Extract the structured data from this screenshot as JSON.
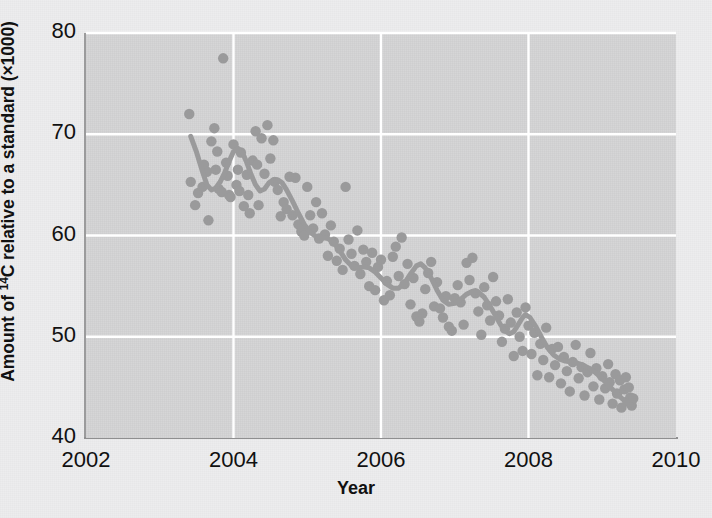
{
  "chart_data": {
    "type": "scatter",
    "title": "",
    "xlabel": "Year",
    "ylabel_parts": {
      "pre": "Amount of ",
      "sup": "14",
      "post": "C relative to a standard (×1000)"
    },
    "ylabel": "Amount of 14C relative to a standard (×1000)",
    "xlim": [
      2002,
      2010
    ],
    "ylim": [
      40,
      80
    ],
    "xticks": [
      "2002",
      "2004",
      "2006",
      "2008",
      "2010"
    ],
    "xtick_values": [
      2002,
      2004,
      2006,
      2008,
      2010
    ],
    "yticks": [
      "40",
      "50",
      "60",
      "70",
      "80"
    ],
    "ytick_values": [
      40,
      50,
      60,
      70,
      80
    ],
    "grid": "white gridlines at each tick, plot background light gray",
    "legend": "none",
    "marker_color": "#9a9a9b",
    "line_color": "#9a9a9b",
    "plot_bg": "#d4d4d5",
    "figure_bg": "#ededee",
    "grid_color": "#ffffff",
    "axis_color": "#909091",
    "series": [
      {
        "name": "14C measurements",
        "type": "scatter",
        "points": [
          [
            2003.4,
            72.0
          ],
          [
            2003.42,
            65.3
          ],
          [
            2003.48,
            63.0
          ],
          [
            2003.52,
            64.2
          ],
          [
            2003.58,
            64.8
          ],
          [
            2003.6,
            67.0
          ],
          [
            2003.64,
            66.3
          ],
          [
            2003.66,
            61.5
          ],
          [
            2003.7,
            69.3
          ],
          [
            2003.74,
            70.6
          ],
          [
            2003.76,
            66.5
          ],
          [
            2003.78,
            68.3
          ],
          [
            2003.8,
            64.6
          ],
          [
            2003.84,
            64.3
          ],
          [
            2003.86,
            77.5
          ],
          [
            2003.9,
            67.2
          ],
          [
            2003.92,
            65.9
          ],
          [
            2003.94,
            64.0
          ],
          [
            2003.96,
            63.8
          ],
          [
            2004.0,
            69.0
          ],
          [
            2004.04,
            65.0
          ],
          [
            2004.06,
            66.5
          ],
          [
            2004.08,
            64.4
          ],
          [
            2004.1,
            68.2
          ],
          [
            2004.14,
            62.9
          ],
          [
            2004.18,
            66.0
          ],
          [
            2004.2,
            64.0
          ],
          [
            2004.22,
            62.2
          ],
          [
            2004.26,
            67.4
          ],
          [
            2004.3,
            70.3
          ],
          [
            2004.32,
            67.0
          ],
          [
            2004.34,
            63.0
          ],
          [
            2004.38,
            69.6
          ],
          [
            2004.42,
            66.1
          ],
          [
            2004.46,
            70.9
          ],
          [
            2004.5,
            67.6
          ],
          [
            2004.54,
            69.4
          ],
          [
            2004.56,
            65.3
          ],
          [
            2004.6,
            64.5
          ],
          [
            2004.64,
            61.9
          ],
          [
            2004.68,
            63.3
          ],
          [
            2004.72,
            62.6
          ],
          [
            2004.76,
            65.8
          ],
          [
            2004.8,
            62.0
          ],
          [
            2004.84,
            65.7
          ],
          [
            2004.88,
            61.1
          ],
          [
            2004.92,
            60.4
          ],
          [
            2004.96,
            60.0
          ],
          [
            2005.0,
            64.8
          ],
          [
            2005.04,
            62.0
          ],
          [
            2005.08,
            60.7
          ],
          [
            2005.12,
            63.3
          ],
          [
            2005.16,
            59.7
          ],
          [
            2005.2,
            62.2
          ],
          [
            2005.24,
            60.1
          ],
          [
            2005.28,
            58.0
          ],
          [
            2005.32,
            61.0
          ],
          [
            2005.36,
            59.4
          ],
          [
            2005.4,
            57.5
          ],
          [
            2005.44,
            58.7
          ],
          [
            2005.48,
            56.6
          ],
          [
            2005.52,
            64.8
          ],
          [
            2005.56,
            59.6
          ],
          [
            2005.6,
            58.2
          ],
          [
            2005.64,
            57.0
          ],
          [
            2005.68,
            60.5
          ],
          [
            2005.72,
            56.2
          ],
          [
            2005.76,
            58.6
          ],
          [
            2005.8,
            57.4
          ],
          [
            2005.84,
            55.0
          ],
          [
            2005.88,
            58.3
          ],
          [
            2005.92,
            54.6
          ],
          [
            2005.96,
            56.9
          ],
          [
            2006.0,
            57.6
          ],
          [
            2006.04,
            53.6
          ],
          [
            2006.08,
            55.5
          ],
          [
            2006.12,
            54.1
          ],
          [
            2006.16,
            57.9
          ],
          [
            2006.2,
            58.9
          ],
          [
            2006.24,
            56.0
          ],
          [
            2006.28,
            59.8
          ],
          [
            2006.32,
            55.2
          ],
          [
            2006.36,
            57.2
          ],
          [
            2006.4,
            53.2
          ],
          [
            2006.44,
            55.8
          ],
          [
            2006.48,
            52.0
          ],
          [
            2006.52,
            51.5
          ],
          [
            2006.56,
            52.3
          ],
          [
            2006.6,
            54.7
          ],
          [
            2006.64,
            56.3
          ],
          [
            2006.68,
            57.4
          ],
          [
            2006.72,
            53.0
          ],
          [
            2006.76,
            55.4
          ],
          [
            2006.8,
            52.8
          ],
          [
            2006.84,
            51.9
          ],
          [
            2006.88,
            54.0
          ],
          [
            2006.92,
            51.0
          ],
          [
            2006.96,
            50.6
          ],
          [
            2007.0,
            53.8
          ],
          [
            2007.04,
            55.1
          ],
          [
            2007.08,
            53.4
          ],
          [
            2007.12,
            51.2
          ],
          [
            2007.16,
            57.3
          ],
          [
            2007.2,
            55.6
          ],
          [
            2007.24,
            57.8
          ],
          [
            2007.28,
            54.3
          ],
          [
            2007.32,
            52.5
          ],
          [
            2007.36,
            50.2
          ],
          [
            2007.4,
            54.9
          ],
          [
            2007.44,
            53.1
          ],
          [
            2007.48,
            51.6
          ],
          [
            2007.52,
            55.9
          ],
          [
            2007.56,
            53.5
          ],
          [
            2007.6,
            52.1
          ],
          [
            2007.64,
            49.5
          ],
          [
            2007.68,
            50.8
          ],
          [
            2007.72,
            53.7
          ],
          [
            2007.76,
            51.4
          ],
          [
            2007.8,
            48.1
          ],
          [
            2007.84,
            52.4
          ],
          [
            2007.88,
            50.0
          ],
          [
            2007.92,
            48.6
          ],
          [
            2007.96,
            52.9
          ],
          [
            2008.0,
            51.1
          ],
          [
            2008.04,
            48.3
          ],
          [
            2008.08,
            50.4
          ],
          [
            2008.12,
            46.2
          ],
          [
            2008.16,
            49.3
          ],
          [
            2008.2,
            47.7
          ],
          [
            2008.24,
            50.9
          ],
          [
            2008.28,
            46.0
          ],
          [
            2008.32,
            48.8
          ],
          [
            2008.36,
            47.2
          ],
          [
            2008.4,
            49.0
          ],
          [
            2008.44,
            45.4
          ],
          [
            2008.48,
            48.0
          ],
          [
            2008.52,
            46.6
          ],
          [
            2008.56,
            44.6
          ],
          [
            2008.6,
            47.5
          ],
          [
            2008.64,
            49.2
          ],
          [
            2008.68,
            45.9
          ],
          [
            2008.72,
            47.0
          ],
          [
            2008.76,
            44.2
          ],
          [
            2008.8,
            46.5
          ],
          [
            2008.84,
            48.4
          ],
          [
            2008.88,
            45.1
          ],
          [
            2008.92,
            46.9
          ],
          [
            2008.96,
            43.8
          ],
          [
            2009.0,
            46.1
          ],
          [
            2009.04,
            44.9
          ],
          [
            2009.08,
            47.3
          ],
          [
            2009.1,
            45.5
          ],
          [
            2009.14,
            43.4
          ],
          [
            2009.18,
            46.3
          ],
          [
            2009.2,
            44.4
          ],
          [
            2009.24,
            45.7
          ],
          [
            2009.26,
            43.0
          ],
          [
            2009.3,
            44.8
          ],
          [
            2009.32,
            46.0
          ],
          [
            2009.34,
            43.6
          ],
          [
            2009.36,
            45.0
          ],
          [
            2009.38,
            44.0
          ],
          [
            2009.4,
            43.2
          ],
          [
            2009.42,
            43.9
          ]
        ]
      },
      {
        "name": "smoothed trend",
        "type": "line",
        "points": [
          [
            2003.42,
            69.8
          ],
          [
            2003.5,
            68.2
          ],
          [
            2003.58,
            66.3
          ],
          [
            2003.64,
            65.0
          ],
          [
            2003.7,
            64.5
          ],
          [
            2003.76,
            64.7
          ],
          [
            2003.82,
            65.3
          ],
          [
            2003.88,
            66.2
          ],
          [
            2003.94,
            67.3
          ],
          [
            2004.0,
            68.3
          ],
          [
            2004.06,
            68.6
          ],
          [
            2004.12,
            68.2
          ],
          [
            2004.18,
            67.2
          ],
          [
            2004.24,
            66.0
          ],
          [
            2004.3,
            65.0
          ],
          [
            2004.36,
            64.4
          ],
          [
            2004.42,
            64.6
          ],
          [
            2004.48,
            65.2
          ],
          [
            2004.54,
            65.5
          ],
          [
            2004.6,
            65.5
          ],
          [
            2004.66,
            65.2
          ],
          [
            2004.72,
            64.5
          ],
          [
            2004.8,
            63.4
          ],
          [
            2004.88,
            62.2
          ],
          [
            2004.96,
            61.1
          ],
          [
            2005.04,
            60.3
          ],
          [
            2005.12,
            59.9
          ],
          [
            2005.2,
            59.8
          ],
          [
            2005.28,
            59.7
          ],
          [
            2005.36,
            59.3
          ],
          [
            2005.44,
            58.5
          ],
          [
            2005.52,
            57.6
          ],
          [
            2005.6,
            57.0
          ],
          [
            2005.68,
            56.8
          ],
          [
            2005.76,
            56.9
          ],
          [
            2005.84,
            56.8
          ],
          [
            2005.92,
            56.4
          ],
          [
            2006.0,
            55.8
          ],
          [
            2006.08,
            55.2
          ],
          [
            2006.16,
            54.8
          ],
          [
            2006.24,
            54.8
          ],
          [
            2006.32,
            55.3
          ],
          [
            2006.4,
            56.2
          ],
          [
            2006.48,
            57.0
          ],
          [
            2006.54,
            57.2
          ],
          [
            2006.6,
            56.8
          ],
          [
            2006.68,
            55.8
          ],
          [
            2006.76,
            54.6
          ],
          [
            2006.84,
            53.6
          ],
          [
            2006.92,
            53.2
          ],
          [
            2007.0,
            53.3
          ],
          [
            2007.08,
            53.7
          ],
          [
            2007.16,
            54.2
          ],
          [
            2007.24,
            54.5
          ],
          [
            2007.32,
            54.4
          ],
          [
            2007.4,
            53.9
          ],
          [
            2007.48,
            53.0
          ],
          [
            2007.56,
            52.0
          ],
          [
            2007.62,
            51.2
          ],
          [
            2007.68,
            50.6
          ],
          [
            2007.74,
            50.3
          ],
          [
            2007.8,
            50.5
          ],
          [
            2007.86,
            51.2
          ],
          [
            2007.92,
            51.9
          ],
          [
            2007.96,
            52.2
          ],
          [
            2008.02,
            51.9
          ],
          [
            2008.1,
            51.0
          ],
          [
            2008.18,
            49.9
          ],
          [
            2008.26,
            48.9
          ],
          [
            2008.34,
            48.2
          ],
          [
            2008.42,
            47.8
          ],
          [
            2008.5,
            47.6
          ],
          [
            2008.58,
            47.5
          ],
          [
            2008.66,
            47.4
          ],
          [
            2008.74,
            47.2
          ],
          [
            2008.82,
            46.9
          ],
          [
            2008.9,
            46.5
          ],
          [
            2008.98,
            46.0
          ],
          [
            2009.06,
            45.4
          ],
          [
            2009.14,
            44.8
          ],
          [
            2009.22,
            44.2
          ],
          [
            2009.3,
            43.7
          ],
          [
            2009.38,
            43.3
          ],
          [
            2009.42,
            43.2
          ]
        ]
      }
    ]
  }
}
